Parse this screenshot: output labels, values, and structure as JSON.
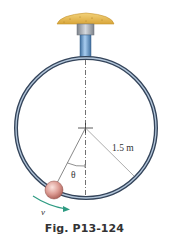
{
  "figure": {
    "caption": "Fig. P13-124",
    "labels": {
      "radius": "1.5 m",
      "angle": "θ",
      "velocity": "v"
    },
    "colors": {
      "ring": "#3a4a5e",
      "ring_highlight": "#a9bcd0",
      "cap": "#e8b84a",
      "neck": "#9a9fa6",
      "stem": "#5d8fc4",
      "ball": "#d9928a",
      "arrow": "#2e9b82",
      "line": "#8a8a8a"
    }
  }
}
